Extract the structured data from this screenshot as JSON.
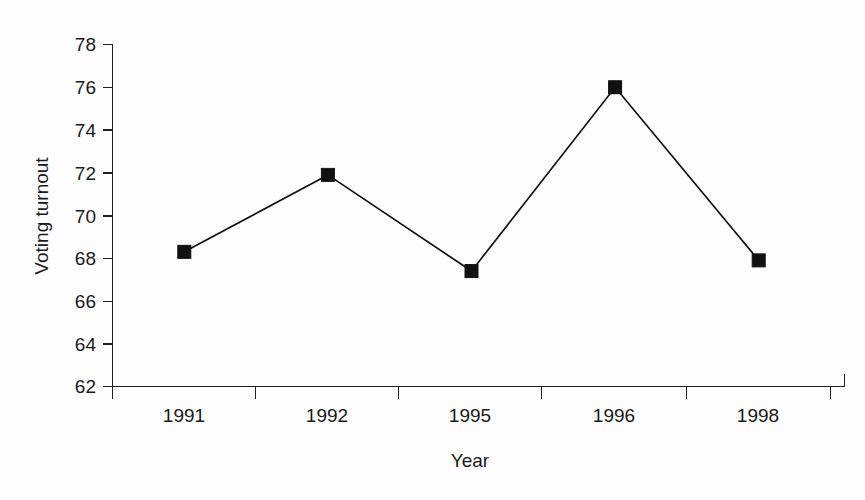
{
  "chart_data": {
    "type": "line",
    "title": "",
    "subtitle": "",
    "xlabel": "Year",
    "ylabel": "Voting turnout",
    "categories": [
      "1991",
      "1992",
      "1995",
      "1996",
      "1998"
    ],
    "values": [
      68.3,
      71.9,
      67.4,
      76.0,
      67.9
    ],
    "series": [
      {
        "name": "Voting turnout",
        "values": [
          68.3,
          71.9,
          67.4,
          76.0,
          67.9
        ],
        "color": "#111111",
        "marker": "filled-square",
        "line_style": "solid"
      }
    ],
    "ylim": [
      62,
      78
    ],
    "yticks": [
      62,
      64,
      66,
      68,
      70,
      72,
      74,
      76,
      78
    ],
    "ytick_labels": [
      "62",
      "64",
      "66",
      "68",
      "70",
      "72",
      "74",
      "76",
      "78"
    ],
    "xticks_at_category_boundaries": true,
    "grid": false,
    "legend": false,
    "legend_position": "none",
    "axis_color": "#1f1f1f",
    "background_color": "#fdfdfd"
  },
  "figure": {
    "x_axis_label": "Year",
    "y_axis_label": "Voting turnout",
    "y_tick_labels": [
      "78",
      "76",
      "74",
      "72",
      "70",
      "68",
      "66",
      "64",
      "62"
    ],
    "x_tick_labels": [
      "1991",
      "1992",
      "1995",
      "1996",
      "1998"
    ]
  }
}
